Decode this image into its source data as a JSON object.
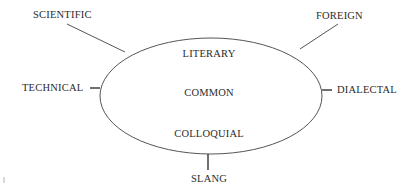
{
  "diagram": {
    "type": "ellipse-with-satellite-labels",
    "ellipse": {
      "center": [
        211,
        96
      ],
      "rx": 111,
      "ry": 58,
      "stroke": "#555555"
    },
    "inner_labels": {
      "top": "LITERARY",
      "middle": "COMMON",
      "bottom": "COLLOQUIAL"
    },
    "outer_labels": {
      "top_left": "SCIENTIFIC",
      "top_right": "FOREIGN",
      "left": "TECHNICAL",
      "right": "DIALECTAL",
      "bottom": "SLANG"
    },
    "connectors": [
      {
        "from": "SCIENTIFIC",
        "to": "ellipse"
      },
      {
        "from": "FOREIGN",
        "to": "ellipse"
      },
      {
        "from": "TECHNICAL",
        "to": "ellipse"
      },
      {
        "from": "DIALECTAL",
        "to": "ellipse"
      },
      {
        "from": "SLANG",
        "to": "ellipse"
      }
    ],
    "colors": {
      "text": "#2b2b2b",
      "line": "#555555",
      "background": "#ffffff"
    }
  }
}
